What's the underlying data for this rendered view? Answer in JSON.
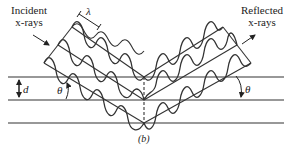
{
  "figure": {
    "panel_label": "(b)"
  },
  "labels": {
    "incident_line1": "Incident",
    "incident_line2": "x-rays",
    "reflected_line1": "Reflected",
    "reflected_line2": "x-rays",
    "wavelength": "λ",
    "spacing": "d",
    "angle_left": "θ",
    "angle_right": "θ"
  },
  "diagram": {
    "planes_y": [
      77,
      100,
      123
    ],
    "vertex_x": 144,
    "line_color": "#333333",
    "wave_count": 3
  }
}
